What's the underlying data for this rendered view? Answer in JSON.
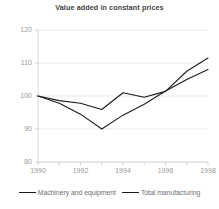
{
  "chart_data": {
    "type": "line",
    "title": "Value added in constant prices",
    "xlabel": "",
    "ylabel": "",
    "x": [
      1990,
      1991,
      1992,
      1993,
      1994,
      1995,
      1996,
      1997,
      1998
    ],
    "xtick_labels": [
      "1990",
      "1992",
      "1994",
      "1996",
      "1998"
    ],
    "xticks": [
      1990,
      1992,
      1994,
      1996,
      1998
    ],
    "minor_xticks": [
      1991,
      1993,
      1995,
      1997
    ],
    "xlim": [
      1990,
      1998
    ],
    "ylim": [
      80,
      120
    ],
    "yticks": [
      80,
      90,
      100,
      110,
      120
    ],
    "ytick_labels": [
      "80",
      "90",
      "100",
      "110",
      "120"
    ],
    "grid": "horizontal",
    "legend_position": "bottom",
    "series": [
      {
        "name": "Machinery and equipment",
        "color": "#1a1a1a",
        "values": [
          100.0,
          97.8,
          94.5,
          90.0,
          94.2,
          97.5,
          101.5,
          105.0,
          108.0
        ]
      },
      {
        "name": "Total manufacturing",
        "color": "#1a1a1a",
        "values": [
          100.0,
          98.6,
          97.8,
          95.9,
          101.0,
          99.6,
          101.4,
          107.5,
          111.5
        ]
      }
    ]
  },
  "legend": {
    "items": [
      {
        "label": "Machinery and equipment"
      },
      {
        "label": "Total manufacturing"
      }
    ]
  }
}
